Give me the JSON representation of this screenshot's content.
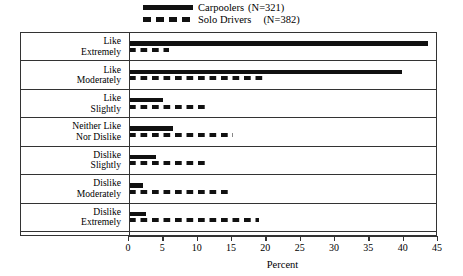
{
  "legend": {
    "entries": [
      {
        "label": "Carpoolers",
        "n_text": "(N=321)",
        "style": "solid",
        "n": 321
      },
      {
        "label": "Solo Drivers",
        "n_text": "(N=382)",
        "style": "dashed",
        "n": 382
      }
    ]
  },
  "axis": {
    "x_title": "Percent",
    "ticks": [
      "0",
      "5",
      "10",
      "15",
      "20",
      "25",
      "30",
      "35",
      "40",
      "45"
    ]
  },
  "categories": [
    {
      "line1": "Like",
      "line2": "Extremely"
    },
    {
      "line1": "Like",
      "line2": "Moderately"
    },
    {
      "line1": "Like",
      "line2": "Slightly"
    },
    {
      "line1": "Neither Like",
      "line2": "Nor Dislike"
    },
    {
      "line1": "Dislike",
      "line2": "Slightly"
    },
    {
      "line1": "Dislike",
      "line2": "Moderately"
    },
    {
      "line1": "Dislike",
      "line2": "Extremely"
    }
  ],
  "chart_data": {
    "type": "bar",
    "orientation": "horizontal",
    "title": "",
    "xlabel": "Percent",
    "ylabel": "",
    "xlim": [
      0,
      45
    ],
    "xticks": [
      0,
      5,
      10,
      15,
      20,
      25,
      30,
      35,
      40,
      45
    ],
    "grid": false,
    "legend_position": "top-center",
    "categories": [
      "Like Extremely",
      "Like Moderately",
      "Like Slightly",
      "Neither Like Nor Dislike",
      "Dislike Slightly",
      "Dislike Moderately",
      "Dislike Extremely"
    ],
    "series": [
      {
        "name": "Carpoolers",
        "n": 321,
        "line_style": "solid",
        "values": [
          43.5,
          39.7,
          5.0,
          6.4,
          4.0,
          2.0,
          2.5
        ]
      },
      {
        "name": "Solo Drivers",
        "n": 382,
        "line_style": "dashed",
        "values": [
          5.8,
          20.0,
          11.0,
          15.2,
          11.2,
          14.7,
          19.0
        ]
      }
    ]
  }
}
